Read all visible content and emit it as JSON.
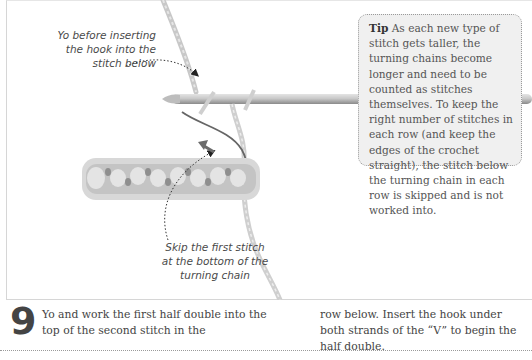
{
  "illustration": {
    "subject": "crochet hook with yarn and half double crochet row",
    "accent_arrow_color": "#6b6b6b",
    "callouts": [
      {
        "id": "yo",
        "text": "Yo before inserting the hook into the stitch below"
      },
      {
        "id": "skip",
        "text": "Skip the first stitch at the bottom of the turning chain"
      }
    ]
  },
  "tip": {
    "title": "Tip",
    "body": "As each new type of stitch gets taller, the turning chains become longer and need to be counted as stitches themselves. To keep the right number of stitches in each row (and keep the edges of the crochet straight), the stitch below the turning chain in each row is skipped and is not worked into."
  },
  "step": {
    "number": "9",
    "text_col1": "Yo and work the first half double into the top of the second stitch in the",
    "text_col2": "row below. Insert the hook under both strands of the “V” to begin the half double."
  }
}
